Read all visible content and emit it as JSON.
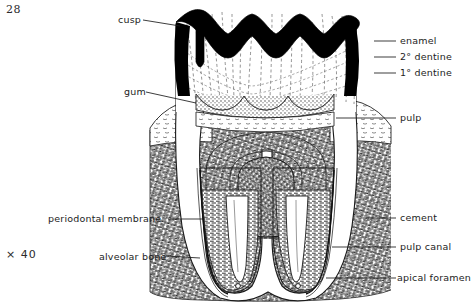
{
  "figure": {
    "page_number": "28",
    "magnification": "× 40"
  },
  "labels": {
    "left": [
      {
        "id": "cusp",
        "text": "cusp",
        "x": 118,
        "y": 20,
        "leader_to_x": 176,
        "leader_to_y": 28
      },
      {
        "id": "gum",
        "text": "gum",
        "x": 124,
        "y": 92,
        "leader_to_x": 186,
        "leader_to_y": 100
      },
      {
        "id": "periodontal-membrane",
        "text": "periodontal membrane",
        "x": 48,
        "y": 219,
        "leader_to_x": 196,
        "leader_to_y": 219
      },
      {
        "id": "alveolar-bone",
        "text": "alveolar bone",
        "x": 99,
        "y": 257,
        "leader_to_x": 198,
        "leader_to_y": 257
      }
    ],
    "right": [
      {
        "id": "enamel",
        "text": "enamel",
        "x": 400,
        "y": 41,
        "leader_from_x": 374,
        "leader_from_y": 41
      },
      {
        "id": "secondary-dentine",
        "text": "2° dentine",
        "x": 400,
        "y": 57,
        "leader_from_x": 374,
        "leader_from_y": 57
      },
      {
        "id": "primary-dentine",
        "text": "1° dentine",
        "x": 400,
        "y": 73,
        "leader_from_x": 374,
        "leader_from_y": 73
      },
      {
        "id": "pulp",
        "text": "pulp",
        "x": 400,
        "y": 118,
        "leader_from_x": 340,
        "leader_from_y": 118
      },
      {
        "id": "cement",
        "text": "cement",
        "x": 400,
        "y": 218,
        "leader_from_x": 366,
        "leader_from_y": 218
      },
      {
        "id": "pulp-canal",
        "text": "pulp canal",
        "x": 400,
        "y": 247,
        "leader_from_x": 360,
        "leader_from_y": 247
      },
      {
        "id": "apical-foramen",
        "text": "apical foramen",
        "x": 400,
        "y": 278,
        "leader_from_x": 362,
        "leader_from_y": 278
      }
    ]
  },
  "colors": {
    "ink": "#1a1a1a",
    "enamel_fill": "#000000",
    "dentine_fill": "#ffffff",
    "secondary_dentine_fill": "#bdbdbd",
    "pulp_fill": "#5a5a5a",
    "bone_fill": "#8e8e8e",
    "background": "#ffffff"
  }
}
